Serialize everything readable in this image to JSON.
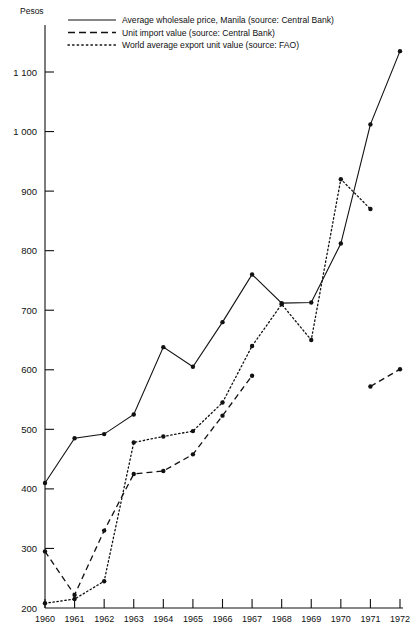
{
  "chart_data": {
    "type": "line",
    "title": "",
    "ylabel": "Pesos",
    "xlabel": "",
    "grid": false,
    "legend_position": "top-left-inside",
    "ylim": [
      200,
      1180
    ],
    "yticks": [
      200,
      300,
      400,
      500,
      600,
      700,
      800,
      900,
      1000,
      1100
    ],
    "ytick_labels": [
      "200",
      "300",
      "400",
      "500",
      "600",
      "700",
      "800",
      "900",
      "1 000",
      "1 100"
    ],
    "xlim": [
      1960,
      1972
    ],
    "x": [
      1960,
      1961,
      1962,
      1963,
      1964,
      1965,
      1966,
      1967,
      1968,
      1969,
      1970,
      1971,
      1972
    ],
    "xtick_labels": [
      "1960",
      "1961",
      "1962",
      "1963",
      "1964",
      "1965",
      "1966",
      "1967",
      "1968",
      "1969",
      "1970",
      "1971",
      "1972"
    ],
    "series": [
      {
        "name": "Average wholesale price, Manila (source: Central Bank)",
        "style": "solid",
        "x": [
          1960,
          1961,
          1962,
          1963,
          1964,
          1965,
          1966,
          1967,
          1968,
          1969,
          1970,
          1971,
          1972
        ],
        "values": [
          410,
          485,
          492,
          525,
          638,
          605,
          680,
          760,
          712,
          713,
          812,
          1012,
          1135
        ]
      },
      {
        "name": "Unit import value (source: Central Bank)",
        "style": "dashed",
        "segments": [
          {
            "x": [
              1960,
              1961,
              1962,
              1963,
              1964,
              1965,
              1966,
              1967
            ],
            "values": [
              295,
              222,
              330,
              425,
              430,
              458,
              523,
              590
            ]
          },
          {
            "x": [
              1971,
              1972
            ],
            "values": [
              572,
              601
            ]
          }
        ]
      },
      {
        "name": "World average export unit value (source: FAO)",
        "style": "dotted",
        "x": [
          1960,
          1961,
          1962,
          1963,
          1964,
          1965,
          1966,
          1967,
          1968,
          1969,
          1970,
          1971
        ],
        "values": [
          208,
          215,
          245,
          478,
          488,
          497,
          545,
          640,
          710,
          650,
          920,
          870
        ]
      }
    ]
  },
  "legend": {
    "entries": [
      {
        "label": "Average wholesale price, Manila (source: Central Bank)",
        "style": "solid"
      },
      {
        "label": "Unit import value (source: Central Bank)",
        "style": "dashed"
      },
      {
        "label": "World average export unit value (source: FAO)",
        "style": "dotted"
      }
    ]
  }
}
